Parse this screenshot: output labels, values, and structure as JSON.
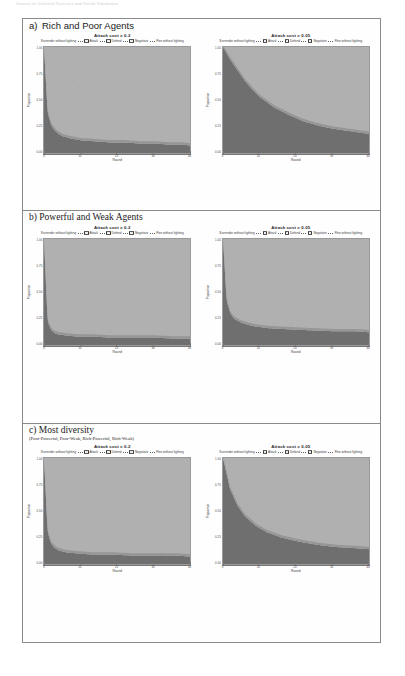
{
  "running_head": "Journal of Artificial Societies and Social Simulation",
  "figure": {
    "sections": [
      {
        "letter": "a)",
        "title": "Rich and Poor Agents",
        "subtitle": "",
        "charts": [
          {
            "title": "Attack cost = 0.2",
            "xlabel": "Round",
            "ylabel": "Proportion",
            "xticks": [
              "0",
              "10",
              "20",
              "30",
              "40"
            ],
            "yticks": [
              "1.00",
              "0.75",
              "0.50",
              "0.25",
              "0.00"
            ],
            "legend": [
              "Surrender without fighting",
              "Attack",
              "Defend",
              "Negotiate",
              "Flee without fighting"
            ]
          },
          {
            "title": "Attack cost = 0.05",
            "xlabel": "Round",
            "ylabel": "Proportion",
            "xticks": [
              "0",
              "10",
              "20",
              "30",
              "40"
            ],
            "yticks": [
              "1.00",
              "0.75",
              "0.50",
              "0.25",
              "0.00"
            ],
            "legend": [
              "Surrender without fighting",
              "Attack",
              "Defend",
              "Negotiate",
              "Flee without fighting"
            ]
          }
        ]
      },
      {
        "letter": "b)",
        "title": "Powerful and Weak Agents",
        "subtitle": "",
        "charts": [
          {
            "title": "Attack cost = 0.2",
            "xlabel": "Round",
            "ylabel": "Proportion",
            "xticks": [
              "0",
              "10",
              "20",
              "30",
              "40"
            ],
            "yticks": [
              "1.00",
              "0.75",
              "0.50",
              "0.25",
              "0.00"
            ],
            "legend": [
              "Surrender without fighting",
              "Attack",
              "Defend",
              "Negotiate",
              "Flee without fighting"
            ]
          },
          {
            "title": "Attack cost = 0.05",
            "xlabel": "Round",
            "ylabel": "Proportion",
            "xticks": [
              "0",
              "10",
              "20",
              "30",
              "40"
            ],
            "yticks": [
              "1.00",
              "0.75",
              "0.50",
              "0.25",
              "0.00"
            ],
            "legend": [
              "Surrender without fighting",
              "Attack",
              "Defend",
              "Negotiate",
              "Flee without fighting"
            ]
          }
        ]
      },
      {
        "letter": "c)",
        "title": "Most diversity",
        "subtitle": "(Poor-Powerful, Poor-Weak, Rich-Powerful, Rich-Weak)",
        "charts": [
          {
            "title": "Attack cost = 0.2",
            "xlabel": "Round",
            "ylabel": "Proportion",
            "xticks": [
              "0",
              "10",
              "20",
              "30",
              "40"
            ],
            "yticks": [
              "1.00",
              "0.75",
              "0.50",
              "0.25",
              "0.00"
            ],
            "legend": [
              "Surrender without fighting",
              "Attack",
              "Defend",
              "Negotiate",
              "Flee without fighting"
            ]
          },
          {
            "title": "Attack cost = 0.05",
            "xlabel": "Round",
            "ylabel": "Proportion",
            "xticks": [
              "0",
              "10",
              "20",
              "30",
              "40"
            ],
            "yticks": [
              "1.00",
              "0.75",
              "0.50",
              "0.25",
              "0.00"
            ],
            "legend": [
              "Surrender without fighting",
              "Attack",
              "Defend",
              "Negotiate",
              "Flee without fighting"
            ]
          }
        ]
      }
    ]
  },
  "colors": {
    "upper_area": "#b0b0b0",
    "lower_area": "#6f6f6f",
    "mid_area": "#8d8d8d",
    "axis": "#8a8a8a",
    "frame": "#8a8a8a"
  },
  "chart_data": [
    {
      "id": "a-02",
      "type": "area",
      "title": "Attack cost = 0.2",
      "xlabel": "Round",
      "ylabel": "Proportion",
      "xlim": [
        0,
        40
      ],
      "ylim": [
        0,
        1
      ],
      "grid": false,
      "legend_position": "top",
      "x": [
        0,
        1,
        2,
        3,
        4,
        5,
        7,
        10,
        14,
        18,
        22,
        26,
        30,
        34,
        38,
        40
      ],
      "series": [
        {
          "name": "Negotiate",
          "values": [
            0.0,
            0.62,
            0.74,
            0.79,
            0.82,
            0.84,
            0.86,
            0.88,
            0.89,
            0.9,
            0.9,
            0.91,
            0.91,
            0.92,
            0.92,
            0.93
          ]
        },
        {
          "name": "Attack",
          "values": [
            1.0,
            0.38,
            0.26,
            0.21,
            0.18,
            0.16,
            0.14,
            0.12,
            0.11,
            0.1,
            0.1,
            0.09,
            0.09,
            0.08,
            0.08,
            0.07
          ]
        }
      ]
    },
    {
      "id": "a-005",
      "type": "area",
      "title": "Attack cost = 0.05",
      "xlabel": "Round",
      "ylabel": "Proportion",
      "xlim": [
        0,
        40
      ],
      "ylim": [
        0,
        1
      ],
      "grid": false,
      "legend_position": "top",
      "x": [
        0,
        2,
        4,
        6,
        8,
        10,
        14,
        18,
        22,
        26,
        30,
        34,
        38,
        40
      ],
      "series": [
        {
          "name": "Negotiate",
          "values": [
            0.0,
            0.12,
            0.22,
            0.32,
            0.4,
            0.47,
            0.57,
            0.64,
            0.7,
            0.74,
            0.77,
            0.79,
            0.81,
            0.82
          ]
        },
        {
          "name": "Attack",
          "values": [
            1.0,
            0.88,
            0.78,
            0.68,
            0.6,
            0.53,
            0.43,
            0.36,
            0.3,
            0.26,
            0.23,
            0.21,
            0.19,
            0.18
          ]
        }
      ]
    },
    {
      "id": "b-02",
      "type": "area",
      "title": "Attack cost = 0.2",
      "xlabel": "Round",
      "ylabel": "Proportion",
      "xlim": [
        0,
        40
      ],
      "ylim": [
        0,
        1
      ],
      "grid": false,
      "legend_position": "top",
      "x": [
        0,
        1,
        2,
        3,
        4,
        6,
        9,
        13,
        18,
        24,
        30,
        36,
        40
      ],
      "series": [
        {
          "name": "Negotiate",
          "values": [
            0.0,
            0.78,
            0.86,
            0.89,
            0.9,
            0.91,
            0.92,
            0.92,
            0.93,
            0.93,
            0.93,
            0.94,
            0.94
          ]
        },
        {
          "name": "Attack",
          "values": [
            1.0,
            0.22,
            0.14,
            0.11,
            0.1,
            0.09,
            0.08,
            0.08,
            0.07,
            0.07,
            0.07,
            0.06,
            0.06
          ]
        }
      ]
    },
    {
      "id": "b-005",
      "type": "area",
      "title": "Attack cost = 0.05",
      "xlabel": "Round",
      "ylabel": "Proportion",
      "xlim": [
        0,
        40
      ],
      "ylim": [
        0,
        1
      ],
      "grid": false,
      "legend_position": "top",
      "x": [
        0,
        1,
        2,
        3,
        5,
        8,
        12,
        17,
        23,
        30,
        36,
        40
      ],
      "series": [
        {
          "name": "Negotiate",
          "values": [
            0.0,
            0.58,
            0.7,
            0.75,
            0.79,
            0.82,
            0.84,
            0.85,
            0.86,
            0.87,
            0.87,
            0.88
          ]
        },
        {
          "name": "Attack",
          "values": [
            1.0,
            0.42,
            0.3,
            0.25,
            0.21,
            0.18,
            0.16,
            0.15,
            0.14,
            0.13,
            0.13,
            0.12
          ]
        }
      ]
    },
    {
      "id": "c-02",
      "type": "area",
      "title": "Attack cost = 0.2",
      "xlabel": "Round",
      "ylabel": "Proportion",
      "xlim": [
        0,
        40
      ],
      "ylim": [
        0,
        1
      ],
      "grid": false,
      "legend_position": "top",
      "x": [
        0,
        1,
        2,
        3,
        4,
        6,
        9,
        13,
        18,
        24,
        30,
        36,
        40
      ],
      "series": [
        {
          "name": "Negotiate",
          "values": [
            0.0,
            0.7,
            0.81,
            0.85,
            0.87,
            0.89,
            0.9,
            0.91,
            0.91,
            0.92,
            0.92,
            0.92,
            0.93
          ]
        },
        {
          "name": "Attack",
          "values": [
            1.0,
            0.3,
            0.19,
            0.15,
            0.13,
            0.11,
            0.1,
            0.09,
            0.09,
            0.08,
            0.08,
            0.08,
            0.07
          ]
        }
      ]
    },
    {
      "id": "c-005",
      "type": "area",
      "title": "Attack cost = 0.05",
      "xlabel": "Round",
      "ylabel": "Proportion",
      "xlim": [
        0,
        40
      ],
      "ylim": [
        0,
        1
      ],
      "grid": false,
      "legend_position": "top",
      "x": [
        0,
        2,
        4,
        6,
        9,
        12,
        16,
        21,
        26,
        31,
        36,
        40
      ],
      "series": [
        {
          "name": "Negotiate",
          "values": [
            0.0,
            0.3,
            0.45,
            0.55,
            0.64,
            0.7,
            0.75,
            0.79,
            0.82,
            0.84,
            0.85,
            0.86
          ]
        },
        {
          "name": "Attack",
          "values": [
            1.0,
            0.7,
            0.55,
            0.45,
            0.36,
            0.3,
            0.25,
            0.21,
            0.18,
            0.16,
            0.15,
            0.14
          ]
        }
      ]
    }
  ]
}
